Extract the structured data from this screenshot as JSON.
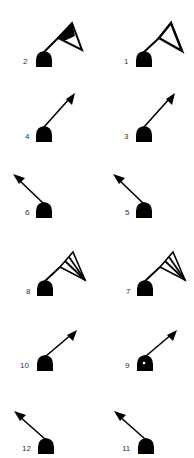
{
  "symbols": [
    {
      "label": "2",
      "type": "flag-filled",
      "col": 0,
      "row": 0
    },
    {
      "label": "1",
      "type": "flag-outline",
      "col": 1,
      "row": 0
    },
    {
      "label": "4",
      "type": "arrow-up-right",
      "col": 0,
      "row": 1
    },
    {
      "label": "3",
      "type": "arrow-up-right",
      "col": 1,
      "row": 1
    },
    {
      "label": "6",
      "type": "arrow-up-left",
      "col": 0,
      "row": 2
    },
    {
      "label": "5",
      "type": "arrow-up-left",
      "col": 1,
      "row": 2
    },
    {
      "label": "8",
      "type": "flag-striped",
      "col": 0,
      "row": 3
    },
    {
      "label": "7",
      "type": "flag-striped",
      "col": 1,
      "row": 3
    },
    {
      "label": "10",
      "type": "arrow-up-right",
      "col": 0,
      "row": 4
    },
    {
      "label": "9",
      "type": "arrow-up-right-dot",
      "col": 1,
      "row": 4
    },
    {
      "label": "12",
      "type": "arrow-up-left",
      "col": 0,
      "row": 5
    },
    {
      "label": "11",
      "type": "arrow-up-left",
      "col": 1,
      "row": 5
    }
  ],
  "colors": {
    "ink": "#000000",
    "label": "#333333",
    "background": "#ffffff"
  }
}
